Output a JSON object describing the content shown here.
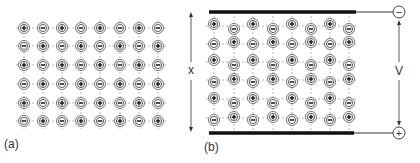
{
  "panel_a": {
    "label": "(a)",
    "description": "Ionic crystal lattice, no applied field",
    "rows": [
      [
        "+",
        "-",
        "+",
        "-",
        "+",
        "-",
        "+",
        "-"
      ],
      [
        "-",
        "+",
        "-",
        "+",
        "-",
        "+",
        "-",
        "+"
      ],
      [
        "+",
        "-",
        "+",
        "-",
        "+",
        "-",
        "+",
        "-"
      ],
      [
        "-",
        "+",
        "-",
        "+",
        "-",
        "+",
        "-",
        "+"
      ],
      [
        "+",
        "-",
        "+",
        "-",
        "+",
        "-",
        "+",
        "-"
      ],
      [
        "-",
        "+",
        "-",
        "+",
        "-",
        "+",
        "-",
        "+"
      ]
    ]
  },
  "panel_b": {
    "label": "(b)",
    "description": "Ionic lattice between charged plates; ions displaced by field",
    "thickness_label": "x",
    "voltage_label": "V",
    "top_terminal_sign": "−",
    "bottom_terminal_sign": "+",
    "columns": 8,
    "rows": 6,
    "first_column_sign": "+"
  },
  "colors": {
    "ink": "#333333",
    "grid": "#888888",
    "plate": "#111111"
  }
}
